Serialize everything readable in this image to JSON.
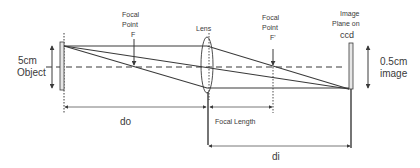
{
  "diagram": {
    "labels": {
      "object_size": "5cm",
      "object": "Object",
      "focal_point_front_l1": "Focal",
      "focal_point_front_l2": "Point",
      "focal_point_front_l3": "F",
      "lens": "Lens",
      "focal_point_back_l1": "Focal",
      "focal_point_back_l2": "Point",
      "focal_point_back_l3": "F'",
      "image_plane_l1": "Image",
      "image_plane_l2": "Plane on",
      "image_plane_l3": "ccd",
      "image_size": "0.5cm",
      "image": "image",
      "do": "do",
      "focal_length": "Focal Length",
      "di": "di"
    },
    "colors": {
      "line": "#3a3a3a",
      "text": "#3a3a3a",
      "plate": "#e6e6e6"
    }
  }
}
